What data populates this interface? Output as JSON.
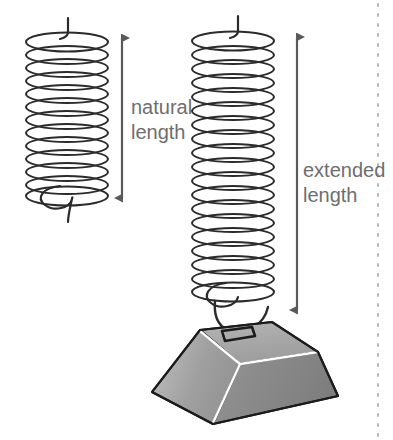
{
  "diagram": {
    "background_color": "#ffffff",
    "width": 393,
    "height": 440,
    "labels": {
      "natural_line1": "natural",
      "natural_line2": "length",
      "extended_line1": "extended",
      "extended_line2": "length",
      "text_color": "#6e6e6e",
      "font_size_px": 20
    },
    "springs": [
      {
        "name": "natural-spring",
        "state": "unloaded",
        "coil_count": 13,
        "top_y": 40,
        "bottom_y": 196,
        "center_x": 67,
        "radius_x": 41,
        "radius_y": 9,
        "stroke_color": "#2b2b2b",
        "stroke_width": 2,
        "has_weight": false,
        "top_hook_stub": true,
        "bottom_hook_loop": true
      },
      {
        "name": "extended-spring",
        "state": "loaded",
        "coil_count": 19,
        "top_y": 40,
        "bottom_y": 303,
        "center_x": 233,
        "radius_x": 41,
        "radius_y": 9,
        "stroke_color": "#2b2b2b",
        "stroke_width": 2,
        "has_weight": true,
        "top_hook_stub": true,
        "bottom_hook_loop": true
      }
    ],
    "arrows": [
      {
        "name": "natural-length-arrow",
        "measures": "natural length",
        "x": 122,
        "y_top": 37,
        "y_bottom": 199,
        "double_headed": true,
        "color": "#5a5a5a",
        "length_px": 162
      },
      {
        "name": "extended-length-arrow",
        "measures": "extended length",
        "x": 297,
        "y_top": 36,
        "y_bottom": 311,
        "double_headed": true,
        "color": "#5a5a5a",
        "length_px": 275
      }
    ],
    "weight": {
      "name": "hanging-weight-block",
      "shape": "trapezoidal-prism",
      "top_face_color": "#a6a6a6",
      "left_face_color": "#9a9a9a",
      "right_face_color": "#8a8a8a",
      "outline_color": "#1c1c1c",
      "highlight_edge_color": "#ffffff",
      "has_eyelet": true,
      "eyelet_name": "weight-attachment-loop"
    },
    "page_divider": {
      "name": "right-dotted-divider",
      "x": 378,
      "style": "dotted",
      "color": "#b9b9b9"
    }
  }
}
